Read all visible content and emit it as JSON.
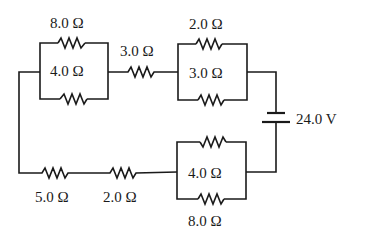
{
  "diagram": {
    "type": "circuit",
    "wire_color": "#1a1a1a",
    "battery": {
      "voltage_label": "24.0 V"
    },
    "top_left_parallel": {
      "upper_label": "8.0 Ω",
      "lower_label": "4.0 Ω"
    },
    "top_series": {
      "label": "3.0 Ω"
    },
    "top_right_parallel": {
      "upper_label": "2.0 Ω",
      "lower_label": "3.0 Ω"
    },
    "bottom_right_parallel": {
      "upper_label": "4.0 Ω",
      "lower_label": "8.0 Ω"
    },
    "bottom_series": [
      {
        "label": "5.0 Ω"
      },
      {
        "label": "2.0 Ω"
      }
    ]
  }
}
